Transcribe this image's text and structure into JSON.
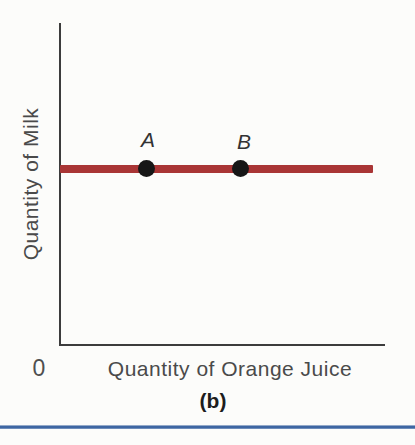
{
  "figure": {
    "y_axis_label": "Quantity of Milk",
    "x_axis_label": "Quantity of Orange Juice",
    "origin_label": "0",
    "caption": "(b)",
    "points": [
      {
        "label": "A"
      },
      {
        "label": "B"
      }
    ],
    "colors": {
      "curve": "#a93535",
      "point_marker": "#161616",
      "axis": "#3c3c3c",
      "axis_text": "#4a4a4a",
      "caption_text": "#1d1d1d",
      "divider_blue": "#3e66a2",
      "divider_blue_light": "#93a9c9",
      "background": "#fcfcfa"
    }
  },
  "chart_data": {
    "type": "line",
    "title": "",
    "xlabel": "Quantity of Orange Juice",
    "ylabel": "Quantity of Milk",
    "caption": "(b)",
    "axes_numeric_ticks": false,
    "grid": false,
    "legend": false,
    "x_range_frac": [
      0,
      1
    ],
    "y_range_frac": [
      0,
      1
    ],
    "series": [
      {
        "name": "indifference-curve",
        "shape": "horizontal-line",
        "color": "#a93535",
        "x_frac": [
          0.0,
          0.963
        ],
        "y_frac": [
          0.55,
          0.55
        ]
      }
    ],
    "annotations": [
      {
        "label": "A",
        "x_frac": 0.27,
        "y_frac": 0.55,
        "marker": "filled-circle",
        "marker_color": "#161616"
      },
      {
        "label": "B",
        "x_frac": 0.56,
        "y_frac": 0.55,
        "marker": "filled-circle",
        "marker_color": "#161616"
      }
    ]
  }
}
